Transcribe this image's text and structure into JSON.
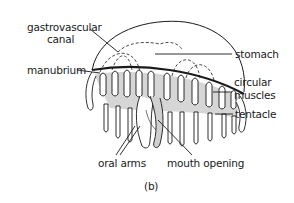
{
  "diagram": {
    "caption": "(b)",
    "labels": {
      "gastrovascular_canal_line1": "gastrovascular",
      "gastrovascular_canal_line2": "canal",
      "manubrium": "manubrium",
      "stomach": "stomach",
      "circular_muscles_line1": "circular",
      "circular_muscles_line2": "muscles",
      "tentacle": "tentacle",
      "oral_arms": "oral arms",
      "mouth_opening": "mouth opening"
    },
    "colors": {
      "ink": "#1a1a1a",
      "background": "#ffffff"
    }
  }
}
